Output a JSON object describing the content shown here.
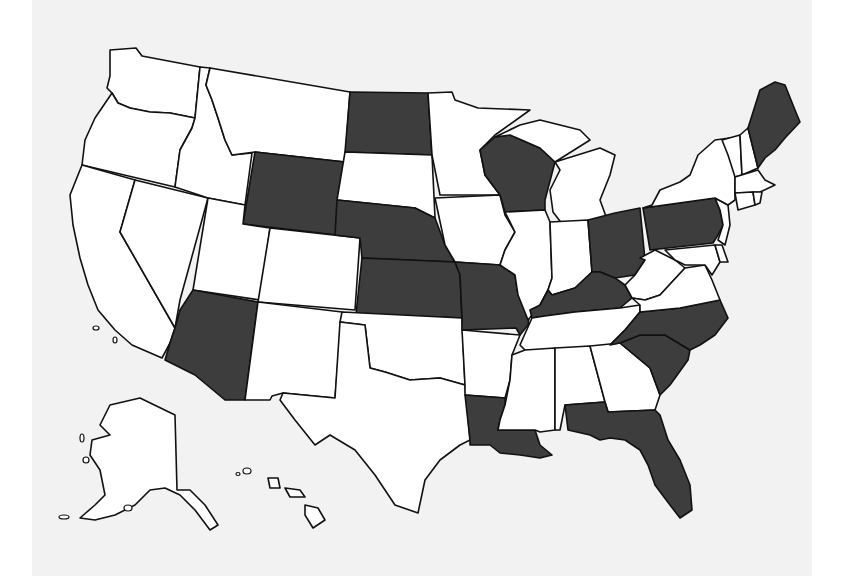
{
  "map": {
    "type": "choropleth",
    "region": "United States",
    "colors": {
      "background": "#f2f2f2",
      "page_margin": "#ffffff",
      "highlighted": "#3d3d3d",
      "default": "#ffffff",
      "border": "#111111"
    },
    "highlighted_states": [
      "WA_none"
    ],
    "legend": null
  },
  "chart_data": {
    "type": "map",
    "title": "",
    "highlighted": [
      "ND",
      "WY",
      "NE",
      "KS",
      "MO",
      "WI",
      "OH",
      "PA",
      "ME",
      "KY",
      "NC",
      "SC",
      "AZ",
      "LA",
      "FL"
    ],
    "not_highlighted": [
      "WA",
      "OR",
      "CA",
      "NV",
      "ID",
      "MT",
      "UT",
      "CO",
      "NM",
      "TX",
      "OK",
      "SD",
      "MN",
      "IA",
      "AR",
      "MS",
      "AL",
      "GA",
      "TN",
      "IL",
      "IN",
      "MI",
      "WV",
      "VA",
      "MD",
      "DE",
      "NJ",
      "NY",
      "CT",
      "RI",
      "MA",
      "VT",
      "NH",
      "AK",
      "HI"
    ]
  },
  "states": [
    {
      "id": "WA",
      "fill": "default",
      "d": "M110,50 L136,48 L142,56 L200,67 L195,118 L170,113 L150,112 L130,108 L118,103 L112,93 L107,88 L110,76 Z"
    },
    {
      "id": "OR",
      "fill": "default",
      "d": "M112,93 L118,103 L130,108 L150,112 L170,113 L195,118 L192,128 L180,150 L175,187 L82,165 L85,140 L95,118 Z"
    },
    {
      "id": "CA",
      "fill": "default",
      "d": "M82,165 L135,180 L120,232 L175,328 L170,343 L162,358 L132,345 L115,330 L98,310 L88,285 L80,258 L73,225 L70,195 Z"
    },
    {
      "id": "NV",
      "fill": "default",
      "d": "M135,180 L208,198 L180,300 L175,328 L120,232 Z"
    },
    {
      "id": "ID",
      "fill": "default",
      "d": "M200,67 L210,68 L206,85 L212,100 L218,118 L225,140 L232,155 L252,153 L245,205 L208,198 L175,187 L180,150 L192,128 L195,118 Z"
    },
    {
      "id": "MT",
      "fill": "default",
      "d": "M210,68 L350,92 L345,162 L255,152 L232,155 L225,140 L218,118 L212,100 L206,85 Z"
    },
    {
      "id": "WY",
      "fill": "highlighted",
      "d": "M255,152 L345,162 L337,235 L243,224 Z"
    },
    {
      "id": "UT",
      "fill": "default",
      "d": "M208,198 L245,205 L243,224 L270,228 L260,300 L193,290 Z"
    },
    {
      "id": "CO",
      "fill": "default",
      "d": "M270,228 L360,238 L355,310 L258,302 Z"
    },
    {
      "id": "AZ",
      "fill": "highlighted",
      "d": "M193,290 L258,302 L245,400 L225,400 L195,375 L165,360 L170,343 L175,328 L180,310 Z"
    },
    {
      "id": "NM",
      "fill": "default",
      "d": "M258,302 L342,312 L335,398 L283,393 L272,396 L270,400 L245,400 Z"
    },
    {
      "id": "ND",
      "fill": "highlighted",
      "d": "M350,92 L428,93 L432,155 L345,152 Z"
    },
    {
      "id": "SD",
      "fill": "default",
      "d": "M345,152 L432,155 L435,218 L415,208 L337,200 Z"
    },
    {
      "id": "NE",
      "fill": "highlighted",
      "d": "M337,200 L415,208 L435,218 L445,245 L455,262 L362,258 L360,238 L335,235 Z"
    },
    {
      "id": "KS",
      "fill": "highlighted",
      "d": "M362,258 L455,262 L460,275 L462,318 L356,314 Z"
    },
    {
      "id": "OK",
      "fill": "default",
      "d": "M342,312 L462,318 L465,385 L440,378 L410,380 L385,372 L370,368 L365,325 L340,322 Z"
    },
    {
      "id": "TX",
      "fill": "default",
      "d": "M340,322 L365,325 L370,368 L385,372 L410,380 L440,378 L465,385 L470,440 L460,445 L440,460 L425,480 L418,513 L395,505 L375,475 L355,450 L330,435 L315,445 L295,420 L280,400 L283,393 L335,398 Z"
    },
    {
      "id": "MN",
      "fill": "default",
      "d": "M428,93 L452,92 L455,100 L478,108 L530,110 L495,135 L480,150 L485,175 L500,195 L440,195 L432,155 Z"
    },
    {
      "id": "IA",
      "fill": "default",
      "d": "M435,198 L500,195 L505,215 L515,232 L505,250 L500,265 L455,262 L445,245 Z"
    },
    {
      "id": "MO",
      "fill": "highlighted",
      "d": "M455,262 L500,265 L515,275 L518,295 L530,310 L528,325 L520,335 L516,328 L462,330 L462,318 L460,275 Z"
    },
    {
      "id": "AR",
      "fill": "default",
      "d": "M462,330 L520,335 L512,355 L510,380 L505,398 L465,395 L465,385 Z"
    },
    {
      "id": "LA",
      "fill": "highlighted",
      "d": "M465,395 L505,398 L505,405 L500,420 L498,430 L535,430 L540,445 L552,455 L540,458 L520,455 L500,453 L490,445 L470,445 L470,440 Z"
    },
    {
      "id": "WI",
      "fill": "highlighted",
      "d": "M480,150 L495,137 L510,135 L540,148 L555,162 L545,200 L545,210 L505,212 L500,195 L485,175 Z"
    },
    {
      "id": "IL",
      "fill": "default",
      "d": "M505,212 L545,210 L550,222 L552,278 L548,290 L540,305 L528,320 L518,295 L515,275 L500,265 L505,250 L515,232 Z"
    },
    {
      "id": "MI",
      "fill": "default",
      "d": "M555,162 L600,148 L615,155 L610,175 L600,200 L608,222 L563,225 L553,212 L550,190 L560,170 Z M495,137 L520,125 L540,120 L580,130 L590,140 L555,162 L540,148 L510,135 Z"
    },
    {
      "id": "IN",
      "fill": "default",
      "d": "M550,222 L588,220 L592,272 L575,288 L552,295 L548,290 L552,278 Z"
    },
    {
      "id": "OH",
      "fill": "highlighted",
      "d": "M588,220 L615,213 L640,208 L645,260 L635,275 L615,278 L600,272 L592,272 Z"
    },
    {
      "id": "KY",
      "fill": "highlighted",
      "d": "M530,310 L540,305 L548,290 L552,295 L575,288 L592,272 L600,272 L615,278 L625,285 L632,298 L620,308 L575,312 L545,316 L532,318 Z"
    },
    {
      "id": "TN",
      "fill": "default",
      "d": "M532,318 L545,316 L575,312 L620,308 L640,305 L640,312 L625,330 L610,345 L555,350 L525,350 L520,345 Z"
    },
    {
      "id": "MS",
      "fill": "default",
      "d": "M525,350 L555,348 L555,430 L540,432 L535,430 L498,430 L500,420 L505,405 L510,380 L512,355 Z"
    },
    {
      "id": "AL",
      "fill": "default",
      "d": "M555,348 L590,346 L605,402 L565,405 L560,430 L555,430 Z"
    },
    {
      "id": "GA",
      "fill": "default",
      "d": "M590,346 L620,343 L650,368 L660,395 L655,410 L608,412 L605,402 Z"
    },
    {
      "id": "SC",
      "fill": "highlighted",
      "d": "M620,343 L640,335 L665,335 L690,350 L688,360 L670,385 L660,395 L650,368 Z"
    },
    {
      "id": "NC",
      "fill": "highlighted",
      "d": "M610,345 L625,330 L640,312 L680,308 L720,300 L728,318 L715,335 L700,345 L690,350 L665,335 L640,335 L620,343 Z"
    },
    {
      "id": "FL",
      "fill": "highlighted",
      "d": "M565,405 L605,402 L608,412 L655,410 L660,415 L668,440 L680,460 L690,485 L692,510 L680,518 L670,505 L655,485 L648,465 L640,450 L625,440 L610,438 L600,440 L590,435 L568,430 Z"
    },
    {
      "id": "WV",
      "fill": "default",
      "d": "M640,258 L655,250 L665,255 L675,260 L685,268 L672,282 L660,295 L645,300 L632,298 L625,285 L635,275 L645,260 Z"
    },
    {
      "id": "VA",
      "fill": "default",
      "d": "M632,298 L645,300 L660,295 L672,282 L685,268 L705,265 L712,280 L720,300 L680,308 L640,312 L640,305 Z"
    },
    {
      "id": "MD",
      "fill": "default",
      "d": "M665,250 L715,245 L720,262 L712,275 L705,265 L685,265 L675,260 Z"
    },
    {
      "id": "DE",
      "fill": "default",
      "d": "M715,245 L722,245 L728,262 L720,262 Z"
    },
    {
      "id": "PA",
      "fill": "highlighted",
      "d": "M643,208 L715,198 L720,210 L723,225 L718,235 L713,243 L650,250 Z"
    },
    {
      "id": "NJ",
      "fill": "default",
      "d": "M715,198 L728,205 L730,225 L725,245 L718,240 L723,225 L720,210 Z"
    },
    {
      "id": "NY",
      "fill": "default",
      "d": "M652,205 L660,190 L680,182 L690,175 L698,155 L715,140 L730,138 L735,165 L735,200 L728,205 L715,198 L643,208 Z"
    },
    {
      "id": "VT",
      "fill": "default",
      "d": "M722,140 L740,135 L742,175 L735,177 L728,155 Z"
    },
    {
      "id": "NH",
      "fill": "default",
      "d": "M740,135 L748,128 L758,168 L742,175 Z"
    },
    {
      "id": "MA",
      "fill": "default",
      "d": "M735,177 L758,170 L765,180 L775,185 L760,192 L735,193 Z"
    },
    {
      "id": "CT",
      "fill": "default",
      "d": "M735,193 L753,192 L755,205 L738,210 Z"
    },
    {
      "id": "RI",
      "fill": "default",
      "d": "M753,192 L762,192 L760,203 L755,205 Z"
    },
    {
      "id": "ME",
      "fill": "highlighted",
      "d": "M758,168 L748,128 L760,90 L775,82 L785,85 L795,110 L800,122 L785,138 L775,150 L765,158 Z"
    },
    {
      "id": "AK",
      "fill": "default",
      "d": "M110,405 L140,398 L175,415 L177,490 L190,490 L205,505 L218,525 L210,530 L195,510 L180,495 L165,488 L150,490 L135,505 L115,515 L95,520 L80,518 L95,505 L105,495 L100,470 L90,455 L92,440 L110,435 L100,425 Z"
    },
    {
      "id": "HI",
      "fill": "default",
      "d": "M268,478 L278,478 L280,488 L270,488 Z M285,488 L300,490 L305,497 L290,497 Z M305,505 L318,508 L325,520 L313,528 L305,515 Z"
    }
  ]
}
